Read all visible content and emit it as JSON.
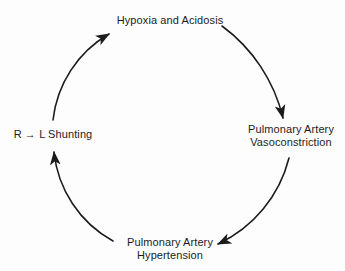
{
  "diagram": {
    "type": "cycle",
    "nodes": {
      "top": {
        "line1": "Hypoxia and Acidosis"
      },
      "right": {
        "line1": "Pulmonary Artery",
        "line2": "Vasoconstriction"
      },
      "bottom": {
        "line1": "Pulmonary Artery",
        "line2": "Hypertension"
      },
      "left": {
        "line1": "R → L Shunting"
      }
    },
    "edges": [
      {
        "from": "Hypoxia and Acidosis",
        "to": "Pulmonary Artery Vasoconstriction"
      },
      {
        "from": "Pulmonary Artery Vasoconstriction",
        "to": "Pulmonary Artery Hypertension"
      },
      {
        "from": "Pulmonary Artery Hypertension",
        "to": "R → L Shunting"
      },
      {
        "from": "R → L Shunting",
        "to": "Hypoxia and Acidosis"
      }
    ],
    "colors": {
      "text": "#1c1c1c",
      "arrow": "#1c1c1c",
      "background": "#fdfdfd"
    }
  }
}
